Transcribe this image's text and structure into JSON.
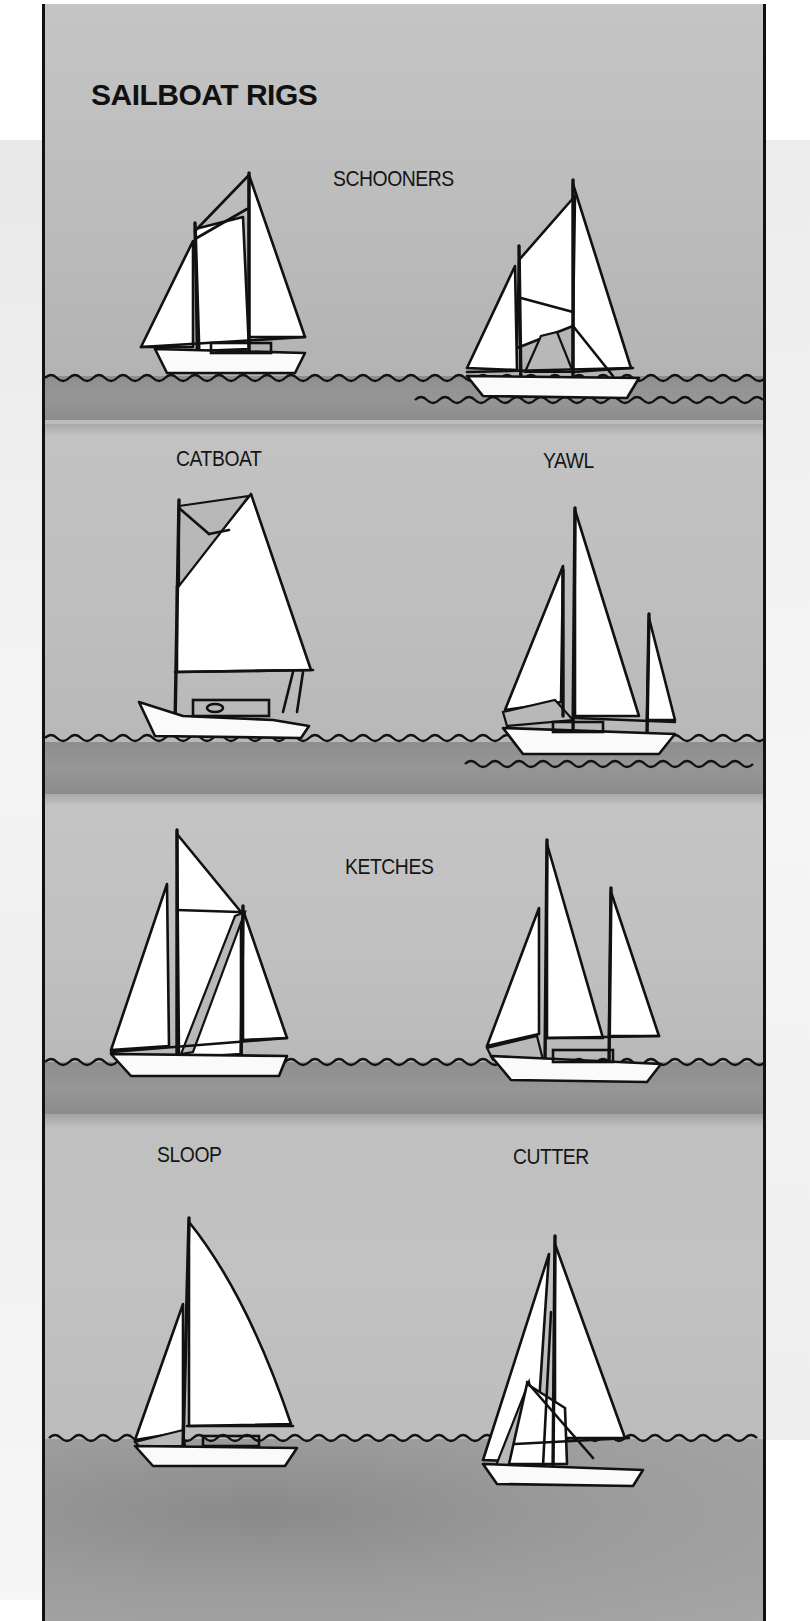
{
  "title": "SAILBOAT RIGS",
  "panels": [
    {
      "id": "schooners",
      "labels": [
        "SCHOONERS"
      ]
    },
    {
      "id": "catboat-yawl",
      "labels": [
        "CATBOAT",
        "YAWL"
      ]
    },
    {
      "id": "ketches",
      "labels": [
        "KETCHES"
      ]
    },
    {
      "id": "sloop-cutter",
      "labels": [
        "SLOOP",
        "CUTTER"
      ]
    }
  ],
  "boats": [
    {
      "name": "schooner-1",
      "rig": "Schooner"
    },
    {
      "name": "schooner-2",
      "rig": "Schooner"
    },
    {
      "name": "catboat",
      "rig": "Catboat"
    },
    {
      "name": "yawl",
      "rig": "Yawl"
    },
    {
      "name": "ketch-1",
      "rig": "Ketch"
    },
    {
      "name": "ketch-2",
      "rig": "Ketch"
    },
    {
      "name": "sloop",
      "rig": "Sloop"
    },
    {
      "name": "cutter",
      "rig": "Cutter"
    }
  ],
  "colors": {
    "sky": "#bdbdbd",
    "water": "#8e8e8e",
    "ink": "#111111",
    "sail": "#ffffff"
  }
}
